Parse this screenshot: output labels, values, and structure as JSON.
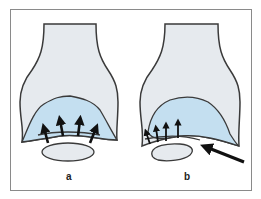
{
  "figure": {
    "panels": [
      {
        "id": "a",
        "label": "a",
        "description": "Centered contact: arrows point upward evenly into cartilage"
      },
      {
        "id": "b",
        "label": "b",
        "description": "Offset contact: arrows concentrated on left edge, large oblique arrow from lower right"
      }
    ]
  },
  "colors": {
    "bone": "#e6eaee",
    "cartilage": "#c4dff0",
    "outline": "#3a3a3a",
    "arrow": "#111111",
    "frame": "#8a8a8a"
  }
}
